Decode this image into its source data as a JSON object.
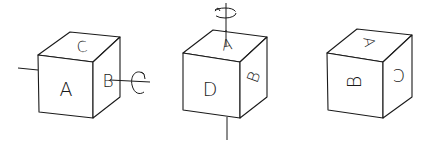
{
  "figure": {
    "stroke_color": "#1a1a1a",
    "background": "#ffffff"
  },
  "cubes": [
    {
      "id": "cube-1",
      "faces": {
        "front": "A",
        "top": "C",
        "right": "B"
      },
      "rotation_axis": "horizontal",
      "rotation_arrow": "curved-arrow-around-horizontal-axis"
    },
    {
      "id": "cube-2",
      "faces": {
        "front": "D",
        "top": "A",
        "right": "B"
      },
      "rotation_axis": "vertical",
      "rotation_arrow": "curved-arrow-around-vertical-axis"
    },
    {
      "id": "cube-3",
      "faces": {
        "front": "B",
        "top": "A",
        "right": "C"
      },
      "rotation_axis": "none"
    }
  ]
}
